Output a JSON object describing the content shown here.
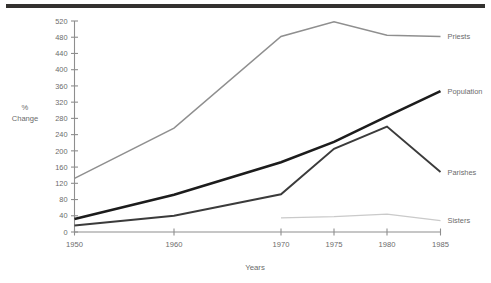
{
  "figure": {
    "top_rule": "horizontal-rule",
    "background_color": "#ffffff"
  },
  "chart_data": {
    "type": "line",
    "title": "",
    "subtitle": "",
    "xlabel": "Years",
    "ylabel": "% Change",
    "ylabel_lines": [
      "%",
      "Change"
    ],
    "categories": [
      "1950",
      "1960",
      "1970",
      "1975",
      "1980",
      "1985"
    ],
    "x": [
      1950,
      1960,
      1970,
      1975,
      1980,
      1985
    ],
    "xtick_labels": [
      "1950",
      "1960",
      "1970",
      "1975",
      "1980",
      "1985"
    ],
    "ytick_labels": [
      "0",
      "40",
      "80",
      "120",
      "160",
      "200",
      "240",
      "280",
      "320",
      "360",
      "400",
      "440",
      "480",
      "520"
    ],
    "yticks": [
      0,
      40,
      80,
      120,
      160,
      200,
      240,
      280,
      320,
      360,
      400,
      440,
      480,
      520
    ],
    "ylim": [
      0,
      520
    ],
    "grid": false,
    "legend_position": "right-inline-labels",
    "series": [
      {
        "name": "Priests",
        "label": "Priests",
        "color": "#8f8f8f",
        "width": 1.5,
        "x": [
          1950,
          1960,
          1970,
          1975,
          1980,
          1985
        ],
        "values": [
          132,
          256,
          482,
          518,
          485,
          482
        ]
      },
      {
        "name": "Population",
        "label": "Population",
        "color": "#1c1c1c",
        "width": 2.6,
        "x": [
          1950,
          1960,
          1970,
          1975,
          1980,
          1985
        ],
        "values": [
          32,
          92,
          172,
          222,
          285,
          347
        ]
      },
      {
        "name": "Parishes",
        "label": "Parishes",
        "color": "#3b3b3b",
        "width": 1.9,
        "x": [
          1950,
          1960,
          1970,
          1975,
          1980,
          1985
        ],
        "values": [
          16,
          40,
          93,
          205,
          260,
          148
        ]
      },
      {
        "name": "Sisters",
        "label": "Sisters",
        "color": "#cacaca",
        "width": 1.3,
        "x": [
          1970,
          1975,
          1980,
          1985
        ],
        "values": [
          35,
          38,
          44,
          28
        ]
      }
    ]
  }
}
